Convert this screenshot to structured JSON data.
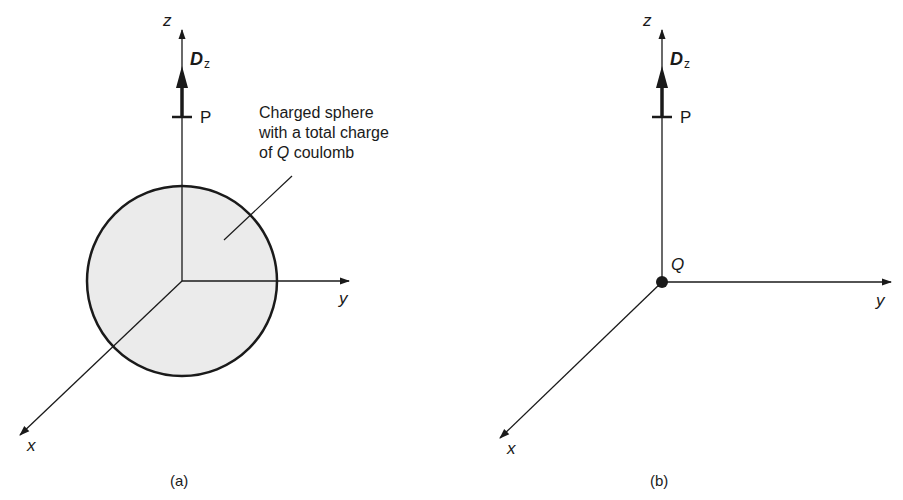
{
  "panels": [
    {
      "id": "a",
      "caption": "(a)",
      "axes": {
        "x": "x",
        "y": "y",
        "z": "z"
      },
      "vector": {
        "symbol": "D",
        "subscript": "z"
      },
      "point_label": "P",
      "annotation": {
        "line1": "Charged sphere",
        "line2": "with a total charge",
        "line3_prefix": "of ",
        "line3_symbol": "Q",
        "line3_suffix": " coulomb"
      }
    },
    {
      "id": "b",
      "caption": "(b)",
      "axes": {
        "x": "x",
        "y": "y",
        "z": "z"
      },
      "vector": {
        "symbol": "D",
        "subscript": "z"
      },
      "point_label": "P",
      "charge_label": "Q"
    }
  ],
  "colors": {
    "line": "#1a1a1a",
    "sphere_fill": "#ebebeb"
  }
}
